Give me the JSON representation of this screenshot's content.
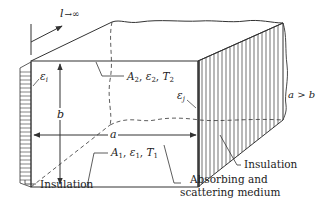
{
  "figure": {
    "length_label": "l→∞",
    "dimension_a": "a",
    "dimension_b": "b",
    "condition": "a > b",
    "top_surface": {
      "area": "A",
      "sub": "2",
      "emissivity": "ε",
      "esub": "2",
      "temp": "T",
      "tsub": "2"
    },
    "bottom_surface": {
      "area": "A",
      "sub": "1",
      "emissivity": "ε",
      "esub": "1",
      "temp": "T",
      "tsub": "1"
    },
    "left_wall_emissivity": {
      "sym": "ε",
      "sub": "i"
    },
    "right_wall_emissivity": {
      "sym": "ε",
      "sub": "j"
    },
    "labels": {
      "insulation_left": "Insulation",
      "insulation_right": "Insulation",
      "medium_line1": "Absorbing and",
      "medium_line2": "scattering medium"
    }
  },
  "colors": {
    "line": "#333333",
    "background": "#ffffff"
  }
}
